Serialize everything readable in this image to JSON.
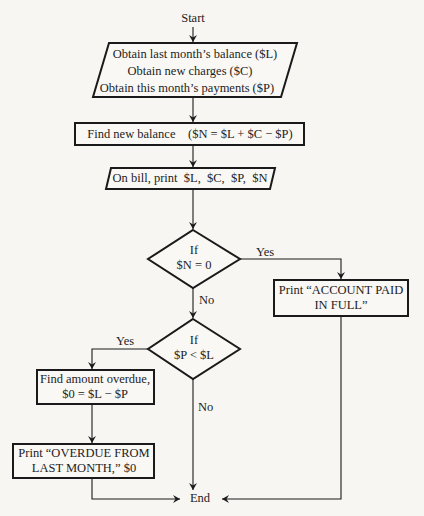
{
  "diagram": {
    "type": "flowchart",
    "start": "Start",
    "end": "End",
    "nodes": {
      "input": {
        "shape": "parallelogram",
        "lines": [
          "Obtain last month’s balance ($L)",
          "Obtain new charges ($C)",
          "Obtain this month’s payments ($P)"
        ]
      },
      "compute_balance": {
        "shape": "rectangle",
        "text": "Find new balance    ($N = $L + $C − $P)"
      },
      "print_bill": {
        "shape": "parallelogram",
        "text": "On bill, print  $L,  $C,  $P,  $N"
      },
      "decision_paid": {
        "shape": "diamond",
        "lines": [
          "If",
          "$N = 0"
        ],
        "yes_label": "Yes",
        "no_label": "No"
      },
      "paid_in_full": {
        "shape": "rectangle",
        "lines": [
          "Print “ACCOUNT PAID",
          "IN FULL”"
        ]
      },
      "decision_overdue": {
        "shape": "diamond",
        "lines": [
          "If",
          "$P < $L"
        ],
        "yes_label": "Yes",
        "no_label": "No"
      },
      "compute_overdue": {
        "shape": "rectangle",
        "lines": [
          "Find amount overdue,",
          "$0 = $L − $P"
        ]
      },
      "print_overdue": {
        "shape": "rectangle",
        "lines": [
          "Print “OVERDUE FROM",
          "LAST MONTH,” $0"
        ]
      }
    },
    "edges": [
      {
        "from": "start",
        "to": "input"
      },
      {
        "from": "input",
        "to": "compute_balance"
      },
      {
        "from": "compute_balance",
        "to": "print_bill"
      },
      {
        "from": "print_bill",
        "to": "decision_paid"
      },
      {
        "from": "decision_paid",
        "to": "paid_in_full",
        "label": "Yes"
      },
      {
        "from": "decision_paid",
        "to": "decision_overdue",
        "label": "No"
      },
      {
        "from": "decision_overdue",
        "to": "compute_overdue",
        "label": "Yes"
      },
      {
        "from": "decision_overdue",
        "to": "end",
        "label": "No"
      },
      {
        "from": "compute_overdue",
        "to": "print_overdue"
      },
      {
        "from": "print_overdue",
        "to": "end"
      },
      {
        "from": "paid_in_full",
        "to": "end"
      }
    ],
    "colors": {
      "background": "#f7f6f3",
      "stroke": "#1a1a1a"
    }
  }
}
